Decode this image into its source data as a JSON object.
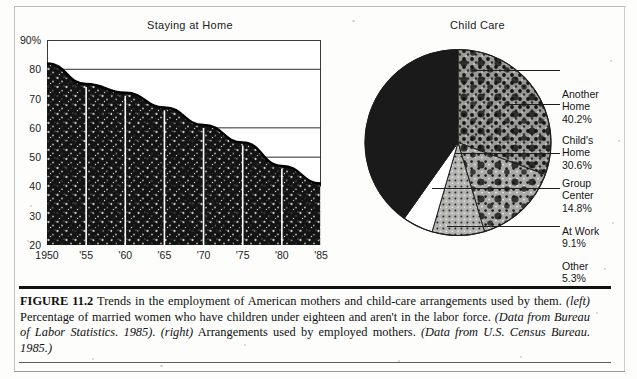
{
  "figure": {
    "label": "FIGURE 11.2",
    "caption_main": " Trends in the employment of American mothers and child-care arrangements used by them. ",
    "caption_left_tag": "(left)",
    "caption_left_text": " Percentage of married women who have children under eighteen and aren't in the labor force. ",
    "caption_source_left": "(Data from Bureau of Labor Statistics. 1985)",
    "caption_right_tag": ". (right)",
    "caption_right_text": " Arrangements used by employed mothers. ",
    "caption_source_right": "(Data from U.S. Census Bureau. 1985.)"
  },
  "chart_data": [
    {
      "type": "area",
      "title": "Staying at Home",
      "xlabel": "",
      "ylabel": "",
      "ylim": [
        20,
        90
      ],
      "xlim": [
        1950,
        1985
      ],
      "grid": true,
      "yticks": [
        "90%",
        "80",
        "70",
        "60",
        "50",
        "40",
        "30",
        "20"
      ],
      "ytick_values": [
        90,
        80,
        70,
        60,
        50,
        40,
        30,
        20
      ],
      "xticks": [
        "1950",
        "'55",
        "'60",
        "'65",
        "'70",
        "'75",
        "'80",
        "'85"
      ],
      "xtick_values": [
        1950,
        1955,
        1960,
        1965,
        1970,
        1975,
        1980,
        1985
      ],
      "x": [
        1950,
        1955,
        1960,
        1965,
        1970,
        1975,
        1980,
        1985
      ],
      "values": [
        82,
        75,
        72,
        67,
        61,
        55,
        47,
        41
      ],
      "series_name": "Percentage of married mothers not in the labor force",
      "fill": "#161616"
    },
    {
      "type": "pie",
      "title": "Child Care",
      "legend_position": "right",
      "labels": [
        "Another Home",
        "Child's Home",
        "Group Center",
        "At Work",
        "Other"
      ],
      "values": [
        40.2,
        30.6,
        14.8,
        9.1,
        5.3
      ],
      "value_labels": [
        "40.2%",
        "30.6%",
        "14.8%",
        "9.1%",
        "5.3%"
      ],
      "slices": [
        {
          "label_line1": "Another",
          "label_line2": "Home",
          "pct": "40.2%",
          "value": 40.2,
          "fill": "#1a1a1a"
        },
        {
          "label_line1": "Child's",
          "label_line2": "Home",
          "pct": "30.6%",
          "value": 30.6,
          "fill": "#6e6e6e"
        },
        {
          "label_line1": "Group",
          "label_line2": "Center",
          "pct": "14.8%",
          "value": 14.8,
          "fill": "#8c8c8c"
        },
        {
          "label_line1": "At Work",
          "label_line2": "",
          "pct": "9.1%",
          "value": 9.1,
          "fill": "#a8a8a8"
        },
        {
          "label_line1": "Other",
          "label_line2": "",
          "pct": "5.3%",
          "value": 5.3,
          "fill": "#ffffff"
        }
      ]
    }
  ]
}
